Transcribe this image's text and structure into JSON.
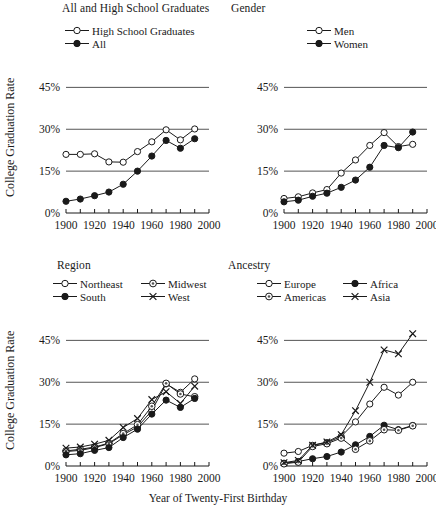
{
  "figure": {
    "xlabel": "Year of Twenty-First Birthday",
    "ylabel": "College Graduation Rate",
    "ytick_labels": [
      "45%",
      "30%",
      "15%",
      "0%"
    ],
    "xtick_labels": [
      "1900",
      "1920",
      "1940",
      "1960",
      "1980",
      "2000"
    ]
  },
  "panels": {
    "tl": {
      "title": "All and High School Graduates"
    },
    "tr": {
      "title": "Gender"
    },
    "bl": {
      "title": "Region"
    },
    "br": {
      "title": "Ancestry"
    }
  },
  "legends": {
    "tl": [
      {
        "label": "High School Graduates",
        "marker": "open-circle"
      },
      {
        "label": "All",
        "marker": "filled-circle"
      }
    ],
    "tr": [
      {
        "label": "Men",
        "marker": "open-circle"
      },
      {
        "label": "Women",
        "marker": "filled-circle"
      }
    ],
    "bl": [
      {
        "label": "Northeast",
        "marker": "open-circle"
      },
      {
        "label": "Midwest",
        "marker": "dotted-circle"
      },
      {
        "label": "South",
        "marker": "filled-circle"
      },
      {
        "label": "West",
        "marker": "cross"
      }
    ],
    "br": [
      {
        "label": "Europe",
        "marker": "open-circle"
      },
      {
        "label": "Africa",
        "marker": "filled-circle"
      },
      {
        "label": "Americas",
        "marker": "dotted-circle"
      },
      {
        "label": "Asia",
        "marker": "cross"
      }
    ]
  },
  "chart_data": [
    {
      "type": "line",
      "title": "All and High School Graduates",
      "xlabel": "Year of Twenty-First Birthday",
      "ylabel": "College Graduation Rate",
      "x": [
        1900,
        1910,
        1920,
        1930,
        1940,
        1950,
        1960,
        1970,
        1980,
        1990
      ],
      "xlim": [
        1900,
        2000
      ],
      "ylim": [
        0,
        48
      ],
      "yticks": [
        0,
        15,
        30,
        45
      ],
      "grid": "horizontal",
      "legend_position": "top",
      "series": [
        {
          "name": "High School Graduates",
          "marker": "open-circle",
          "values": [
            21.0,
            21.0,
            21.2,
            18.3,
            18.2,
            22.0,
            25.5,
            29.8,
            26.2,
            30.1
          ]
        },
        {
          "name": "All",
          "marker": "filled-circle",
          "values": [
            4.2,
            5.0,
            6.2,
            7.5,
            10.3,
            15.0,
            20.4,
            26.0,
            23.2,
            26.6
          ]
        }
      ]
    },
    {
      "type": "line",
      "title": "Gender",
      "xlabel": "Year of Twenty-First Birthday",
      "ylabel": "College Graduation Rate",
      "x": [
        1900,
        1910,
        1920,
        1930,
        1940,
        1950,
        1960,
        1970,
        1980,
        1990
      ],
      "xlim": [
        1900,
        2000
      ],
      "ylim": [
        0,
        48
      ],
      "yticks": [
        0,
        15,
        30,
        45
      ],
      "grid": "horizontal",
      "legend_position": "top",
      "series": [
        {
          "name": "Men",
          "marker": "open-circle",
          "values": [
            5.2,
            5.8,
            7.2,
            8.4,
            14.3,
            19.0,
            24.2,
            28.8,
            23.8,
            24.6
          ]
        },
        {
          "name": "Women",
          "marker": "filled-circle",
          "values": [
            4.0,
            4.6,
            6.0,
            7.1,
            9.2,
            11.8,
            16.4,
            24.2,
            23.4,
            29.0
          ]
        }
      ]
    },
    {
      "type": "line",
      "title": "Region",
      "xlabel": "Year of Twenty-First Birthday",
      "ylabel": "College Graduation Rate",
      "x": [
        1900,
        1910,
        1920,
        1930,
        1940,
        1950,
        1960,
        1970,
        1980,
        1990
      ],
      "xlim": [
        1900,
        2000
      ],
      "ylim": [
        0,
        48
      ],
      "yticks": [
        0,
        15,
        30,
        45
      ],
      "grid": "horizontal",
      "legend_position": "top",
      "series": [
        {
          "name": "Northeast",
          "marker": "open-circle",
          "values": [
            5.2,
            5.6,
            6.6,
            8.0,
            11.2,
            14.0,
            19.8,
            29.4,
            26.4,
            31.2
          ]
        },
        {
          "name": "Midwest",
          "marker": "dotted-circle",
          "values": [
            5.4,
            6.0,
            6.8,
            8.2,
            11.6,
            14.8,
            21.4,
            29.6,
            25.8,
            24.8
          ]
        },
        {
          "name": "South",
          "marker": "filled-circle",
          "values": [
            4.0,
            4.4,
            5.6,
            6.6,
            10.2,
            13.2,
            18.6,
            23.6,
            21.0,
            24.2
          ]
        },
        {
          "name": "West",
          "marker": "cross",
          "values": [
            6.4,
            6.8,
            7.8,
            9.2,
            13.8,
            17.0,
            23.8,
            26.6,
            22.4,
            28.6
          ]
        }
      ]
    },
    {
      "type": "line",
      "title": "Ancestry",
      "xlabel": "Year of Twenty-First Birthday",
      "ylabel": "College Graduation Rate",
      "x": [
        1900,
        1910,
        1920,
        1930,
        1940,
        1950,
        1960,
        1970,
        1980,
        1990
      ],
      "xlim": [
        1900,
        2000
      ],
      "ylim": [
        0,
        50
      ],
      "yticks": [
        0,
        15,
        30,
        45
      ],
      "grid": "horizontal",
      "legend_position": "top",
      "series": [
        {
          "name": "Europe",
          "marker": "open-circle",
          "values": [
            4.6,
            5.2,
            7.4,
            8.4,
            10.6,
            15.8,
            22.2,
            28.2,
            25.4,
            30.0
          ]
        },
        {
          "name": "Africa",
          "marker": "filled-circle",
          "values": [
            1.0,
            1.6,
            2.6,
            3.4,
            5.0,
            7.6,
            10.6,
            14.6,
            13.0,
            14.5
          ]
        },
        {
          "name": "Americas",
          "marker": "dotted-circle",
          "values": [
            0.8,
            1.4,
            7.0,
            8.0,
            10.0,
            6.0,
            9.0,
            13.0,
            12.8,
            14.4
          ]
        },
        {
          "name": "Asia",
          "marker": "cross",
          "values": [
            1.2,
            2.0,
            7.4,
            8.6,
            11.2,
            19.8,
            30.0,
            41.6,
            40.2,
            47.4
          ]
        }
      ]
    }
  ]
}
